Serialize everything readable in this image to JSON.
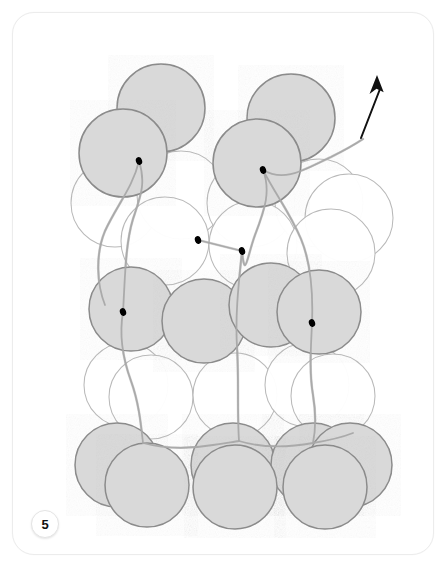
{
  "figure": {
    "number_label": "5",
    "caption": "",
    "title": "",
    "kind": "close-packed sphere stacking model",
    "background_color": "#ffffff",
    "card": {
      "border_color": "#ececec",
      "radius_px": 22,
      "x": 12,
      "y": 12,
      "width": 420,
      "height": 541
    }
  },
  "palette": {
    "sphere_filled_fill": "#d9d9d9",
    "sphere_filled_stroke": "#8b8b8b",
    "sphere_open_fill": "#ffffff",
    "sphere_open_stroke": "#b9b9b9",
    "thread_color": "#a8a8a8",
    "vertex_dot_color": "#000000",
    "arrow_color": "#111111",
    "badge_text_color": "#111111"
  },
  "arrow": {
    "name": "direction-arrow",
    "description": "black arrow pointing up and slightly right at top right of figure",
    "tail": {
      "x": 348,
      "y": 125
    },
    "head": {
      "x": 364,
      "y": 62
    },
    "color": "#111111"
  },
  "spheres": [
    {
      "id": "s1",
      "cx": 148,
      "cy": 95,
      "r": 44,
      "style": "filled",
      "layer": "A-top-back"
    },
    {
      "id": "s2",
      "cx": 278,
      "cy": 105,
      "r": 44,
      "style": "filled",
      "layer": "A-top-back"
    },
    {
      "id": "s3",
      "cx": 110,
      "cy": 140,
      "r": 44,
      "style": "filled",
      "layer": "A-top-front",
      "vertex": {
        "x": 126,
        "y": 148
      }
    },
    {
      "id": "s4",
      "cx": 244,
      "cy": 150,
      "r": 44,
      "style": "filled",
      "layer": "A-top-front",
      "vertex": {
        "x": 250,
        "y": 157
      }
    },
    {
      "id": "s5",
      "cx": 102,
      "cy": 190,
      "r": 44,
      "style": "open",
      "layer": "B-upper"
    },
    {
      "id": "s6",
      "cx": 168,
      "cy": 182,
      "r": 44,
      "style": "open",
      "layer": "B-upper"
    },
    {
      "id": "s7",
      "cx": 238,
      "cy": 190,
      "r": 44,
      "style": "open",
      "layer": "B-upper"
    },
    {
      "id": "s8",
      "cx": 306,
      "cy": 190,
      "r": 44,
      "style": "open",
      "layer": "B-upper"
    },
    {
      "id": "s9",
      "cx": 336,
      "cy": 205,
      "r": 44,
      "style": "open",
      "layer": "B-upper"
    },
    {
      "id": "s10",
      "cx": 152,
      "cy": 228,
      "r": 44,
      "style": "open",
      "layer": "B-lower",
      "vertex": {
        "x": 185,
        "y": 227
      }
    },
    {
      "id": "s11",
      "cx": 240,
      "cy": 232,
      "r": 44,
      "style": "open",
      "layer": "B-lower",
      "vertex": {
        "x": 229,
        "y": 238
      }
    },
    {
      "id": "s12",
      "cx": 318,
      "cy": 240,
      "r": 44,
      "style": "open",
      "layer": "B-lower"
    },
    {
      "id": "s13",
      "cx": 118,
      "cy": 296,
      "r": 42,
      "style": "filled",
      "layer": "C-mid",
      "vertex": {
        "x": 110,
        "y": 299
      }
    },
    {
      "id": "s14",
      "cx": 191,
      "cy": 308,
      "r": 42,
      "style": "filled",
      "layer": "C-mid"
    },
    {
      "id": "s15",
      "cx": 258,
      "cy": 292,
      "r": 42,
      "style": "filled",
      "layer": "C-mid"
    },
    {
      "id": "s16",
      "cx": 306,
      "cy": 299,
      "r": 42,
      "style": "filled",
      "layer": "C-mid",
      "vertex": {
        "x": 299,
        "y": 310
      }
    },
    {
      "id": "s17",
      "cx": 113,
      "cy": 372,
      "r": 42,
      "style": "open",
      "layer": "D-lower"
    },
    {
      "id": "s18",
      "cx": 138,
      "cy": 384,
      "r": 42,
      "style": "open",
      "layer": "D-lower"
    },
    {
      "id": "s19",
      "cx": 222,
      "cy": 382,
      "r": 42,
      "style": "open",
      "layer": "D-lower"
    },
    {
      "id": "s20",
      "cx": 294,
      "cy": 372,
      "r": 42,
      "style": "open",
      "layer": "D-lower"
    },
    {
      "id": "s21",
      "cx": 320,
      "cy": 383,
      "r": 42,
      "style": "open",
      "layer": "D-lower"
    },
    {
      "id": "s22",
      "cx": 104,
      "cy": 452,
      "r": 42,
      "style": "filled",
      "layer": "E-bottom-back"
    },
    {
      "id": "s23",
      "cx": 220,
      "cy": 452,
      "r": 42,
      "style": "filled",
      "layer": "E-bottom-back"
    },
    {
      "id": "s24",
      "cx": 300,
      "cy": 452,
      "r": 42,
      "style": "filled",
      "layer": "E-bottom-back"
    },
    {
      "id": "s25",
      "cx": 337,
      "cy": 452,
      "r": 42,
      "style": "filled",
      "layer": "E-bottom-back"
    },
    {
      "id": "s26",
      "cx": 134,
      "cy": 472,
      "r": 42,
      "style": "filled",
      "layer": "E-bottom-front"
    },
    {
      "id": "s27",
      "cx": 222,
      "cy": 474,
      "r": 42,
      "style": "filled",
      "layer": "E-bottom-front"
    },
    {
      "id": "s28",
      "cx": 312,
      "cy": 474,
      "r": 42,
      "style": "filled",
      "layer": "E-bottom-front"
    }
  ],
  "threads": [
    {
      "id": "t1",
      "path": "M126,148 C133,170 128,182 120,206 C112,232 112,268 110,299",
      "label": "left-upper-chain"
    },
    {
      "id": "t2",
      "path": "M250,157 C258,178 252,196 242,222 C234,244 232,268 229,238",
      "label": "right-upper-chain"
    },
    {
      "id": "t3",
      "path": "M185,227 L229,238",
      "label": "mid-horizontal-link"
    },
    {
      "id": "t4",
      "path": "M229,238 C226,268 222,300 224,334 C226,366 224,398 226,428",
      "label": "center-vertical-chain"
    },
    {
      "id": "t5",
      "path": "M110,299 C106,322 110,346 118,368 C126,390 128,412 130,430",
      "label": "left-lower-chain"
    },
    {
      "id": "t6",
      "path": "M299,310 C298,334 296,358 300,382 C304,406 302,420 300,430",
      "label": "right-lower-chain"
    },
    {
      "id": "t7",
      "path": "M250,157 C272,170 292,156 318,144 C334,136 344,130 350,126",
      "label": "arrow-tail-thread"
    },
    {
      "id": "t8",
      "path": "M226,428 C252,436 278,434 300,430 C318,427 330,424 340,420",
      "label": "bottom-horizontal-chain"
    },
    {
      "id": "t9",
      "path": "M130,430 C152,436 176,436 200,432 C212,430 220,429 226,428",
      "label": "bottom-left-chain"
    },
    {
      "id": "t10",
      "path": "M126,148 C120,174 104,192 92,218 C82,242 84,272 92,292",
      "label": "left-outer-chain"
    },
    {
      "id": "t11",
      "path": "M250,157 C264,184 276,198 288,226 C298,250 300,284 299,310",
      "label": "right-inner-chain"
    }
  ]
}
